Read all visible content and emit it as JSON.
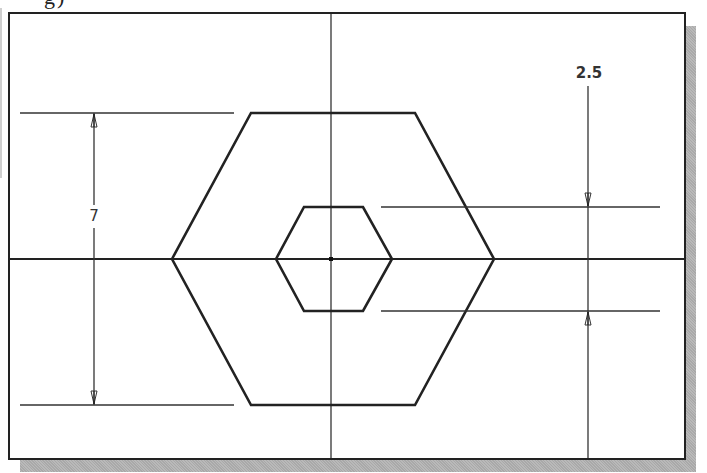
{
  "caption": {
    "fragment": "g)"
  },
  "drawing": {
    "frame": {
      "x": 8,
      "y": 12,
      "w": 676,
      "h": 446
    },
    "centerlines": {
      "horizontal_y": 259,
      "vertical_x": 331
    },
    "outer_hexagon": {
      "points": "172,259 251,113 415,113 494,259 415,405 251,405"
    },
    "inner_hexagon": {
      "points": "276,259 304,207 363,207 392,259 363,311 304,311"
    },
    "center_point": {
      "x": 331,
      "y": 259
    }
  },
  "dimensions": {
    "height_outer": {
      "value": "7",
      "label_x": 94,
      "label_y": 221
    },
    "height_inner": {
      "value": "2.5",
      "label_x": 588,
      "label_y": 78
    }
  },
  "colors": {
    "line": "#222222",
    "dimension": "#333333",
    "shadow": "#b0b0b0"
  }
}
